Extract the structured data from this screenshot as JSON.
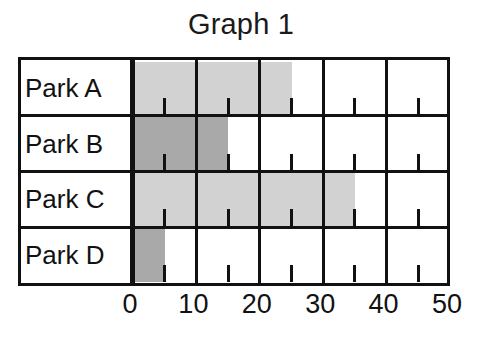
{
  "chart_data": {
    "type": "bar",
    "orientation": "horizontal",
    "title": "Graph 1",
    "xlabel": "",
    "ylabel": "",
    "categories": [
      "Park A",
      "Park B",
      "Park C",
      "Park D"
    ],
    "values": [
      25,
      15,
      35,
      5
    ],
    "bar_colors": [
      "#d2d2d2",
      "#a9a9a9",
      "#d2d2d2",
      "#a9a9a9"
    ],
    "xlim": [
      0,
      50
    ],
    "xticks": [
      0,
      10,
      20,
      30,
      40,
      50
    ],
    "xtick_labels": [
      "0",
      "10",
      "20",
      "30",
      "40",
      "50"
    ],
    "minor_xticks": [
      5,
      15,
      25,
      35,
      45
    ],
    "grid": true,
    "legend": null,
    "series": [
      {
        "name": "Graph 1",
        "points": [
          {
            "category": "Park A",
            "value": 25,
            "color": "#d2d2d2"
          },
          {
            "category": "Park B",
            "value": 15,
            "color": "#a9a9a9"
          },
          {
            "category": "Park C",
            "value": 35,
            "color": "#d2d2d2"
          },
          {
            "category": "Park D",
            "value": 5,
            "color": "#a9a9a9"
          }
        ]
      }
    ]
  },
  "colors": {
    "light_gray": "#d2d2d2",
    "dark_gray": "#a9a9a9",
    "ink": "#111111",
    "background": "#ffffff"
  }
}
